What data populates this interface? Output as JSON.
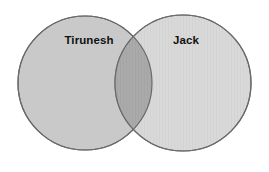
{
  "diagram": {
    "type": "venn",
    "title": "",
    "background_color": "#ffffff",
    "stroke_color": "#6a6a6a",
    "sets": [
      {
        "id": "left",
        "label": "Tirunesh",
        "fill_color": "#c9c9c9",
        "center_x": 85,
        "center_y": 83,
        "radius": 67,
        "label_x": 89,
        "label_y": 41
      },
      {
        "id": "right",
        "label": "Jack",
        "fill_color": "#d7d7d7",
        "center_x": 183,
        "center_y": 83,
        "radius": 68,
        "label_x": 186,
        "label_y": 41
      }
    ],
    "intersection": {
      "label": "",
      "fill_color": "#a9a9a9",
      "top_point_x": 138,
      "top_point_y": 33,
      "bottom_point_x": 138,
      "bottom_point_y": 132
    }
  }
}
